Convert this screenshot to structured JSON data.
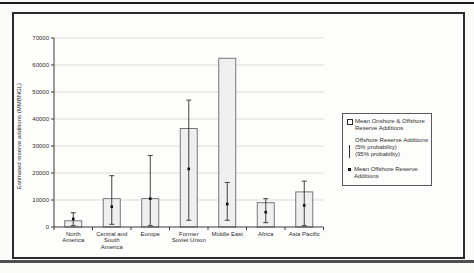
{
  "colors": {
    "bar_fill": "#efefef",
    "bar_border": "#6a6a6a",
    "grid": "#cfcfcf",
    "axis": "#3a3a3a",
    "error": "#2f2f2f",
    "point": "#0f0f0f",
    "text": "#2e2e2e"
  },
  "chart_data": {
    "type": "bar",
    "title": "",
    "xlabel": "",
    "ylabel": "Estimated reserve additions (MMBNGL)",
    "ylim": [
      0,
      70000
    ],
    "ytick_step": 10000,
    "grid": true,
    "legend_position": "right",
    "categories": [
      "North America",
      "Central and South America",
      "Europe",
      "Former Soviet Union",
      "Middle East",
      "Africa",
      "Asia Pacific"
    ],
    "category_lines": [
      [
        "North",
        "America"
      ],
      [
        "Central and",
        "South",
        "America"
      ],
      [
        "Europe"
      ],
      [
        "Former",
        "Soviet Union"
      ],
      [
        "Middle East"
      ],
      [
        "Africa"
      ],
      [
        "Asia Pacific"
      ]
    ],
    "series": [
      {
        "name": "Mean Onshore & Offshore Reserve Additions",
        "type": "bar",
        "values": [
          2300,
          10500,
          10500,
          36500,
          62500,
          9000,
          13000
        ]
      },
      {
        "name": "Offshore Reserve Additions (5% probability)",
        "type": "error-high",
        "values": [
          5300,
          19000,
          26500,
          47000,
          16500,
          10500,
          17000
        ]
      },
      {
        "name": "Offshore Reserve Additions (95% probability)",
        "type": "error-low",
        "values": [
          500,
          1000,
          500,
          2500,
          2500,
          1600,
          500
        ]
      },
      {
        "name": "Mean Offshore Reserve Additions",
        "type": "point",
        "values": [
          3000,
          7500,
          10500,
          21500,
          8500,
          5500,
          8000
        ]
      }
    ]
  },
  "legend": {
    "items": [
      {
        "symbol": "open-square",
        "lines": [
          "Mean Onshore & Offshore",
          "Reserve Additions"
        ]
      },
      {
        "symbol": "error-bar",
        "lines": [
          "Offshore Reserve Additions",
          "(5% probability)",
          "(95% probability)"
        ]
      },
      {
        "symbol": "filled-square",
        "lines": [
          "Mean Offshore Reserve",
          "Additions"
        ]
      }
    ]
  }
}
